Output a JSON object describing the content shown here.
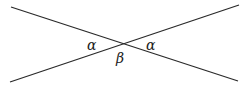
{
  "figure": {
    "kind": "geometry-diagram",
    "canvas": {
      "width": 245,
      "height": 88,
      "background": "#ffffff"
    },
    "stroke": {
      "color": "#2a2a2a",
      "width": 1.3
    },
    "intersection": {
      "x": 122,
      "y": 48
    },
    "lines": [
      {
        "id": "line-descending",
        "name": "line-top-left-to-bottom-right",
        "x1": 11,
        "y1": 7,
        "x2": 238,
        "y2": 81
      },
      {
        "id": "line-ascending",
        "name": "line-bottom-left-to-top-right",
        "x1": 10,
        "y1": 82,
        "x2": 239,
        "y2": 5
      }
    ],
    "labels": [
      {
        "id": "alpha-left",
        "text": "α",
        "x": 87,
        "y": 38,
        "font_size": 14
      },
      {
        "id": "alpha-right",
        "text": "α",
        "x": 146,
        "y": 38,
        "font_size": 14
      },
      {
        "id": "beta-bottom",
        "text": "β",
        "x": 116,
        "y": 51,
        "font_size": 14
      }
    ]
  }
}
